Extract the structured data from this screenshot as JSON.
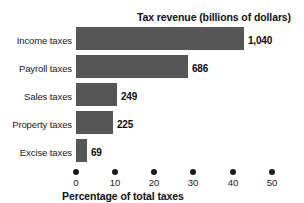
{
  "chart_data": {
    "type": "bar",
    "orientation": "horizontal",
    "title": "Tax revenue (billions of dollars)",
    "xlabel": "Percentage of total taxes",
    "ylabel": "",
    "categories": [
      "Income taxes",
      "Payroll taxes",
      "Sales taxes",
      "Property taxes",
      "Excise taxes"
    ],
    "values": [
      42.9,
      28.6,
      10.4,
      9.4,
      2.8
    ],
    "data_labels": [
      "1,040",
      "686",
      "249",
      "225",
      "69"
    ],
    "revenue_billions": [
      1040,
      686,
      249,
      225,
      69
    ],
    "xlim": [
      0,
      50
    ],
    "xticks": [
      0,
      10,
      20,
      30,
      40,
      50
    ],
    "xtick_labels": [
      "0",
      "10",
      "20",
      "30",
      "40",
      "50"
    ],
    "grid": false,
    "legend": "none",
    "bar_color": "#565656",
    "text_color": "#111111",
    "background": "#ffffff"
  }
}
